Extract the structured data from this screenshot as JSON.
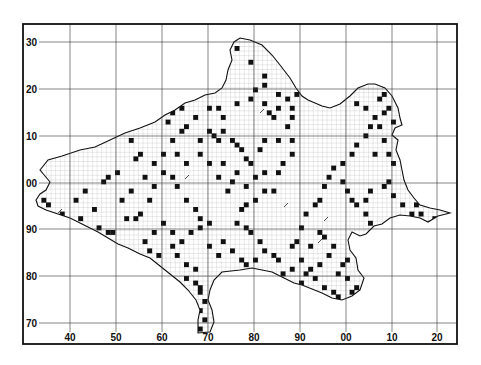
{
  "map": {
    "frame": {
      "left": 23,
      "top": 24,
      "right": 457,
      "bottom": 344
    },
    "x_lines": [
      70,
      116,
      162,
      208,
      254,
      300,
      346,
      392,
      437
    ],
    "x_labels": [
      "40",
      "50",
      "60",
      "70",
      "80",
      "90",
      "00",
      "10",
      "20"
    ],
    "y_lines": [
      42,
      89,
      136,
      183,
      229,
      276,
      323
    ],
    "y_labels": [
      "30",
      "20",
      "10",
      "00",
      "90",
      "80",
      "70"
    ],
    "cell": 4.6,
    "colors": {
      "ink": "#111111",
      "fill": "#ffffff",
      "fine_grid": "#9a9a9a",
      "grid": "#333333"
    },
    "outline": "M40,170 L48,160 L62,156 L80,150 L95,147 L110,140 L125,133 L140,128 L155,122 L165,115 L175,110 L185,103 L195,100 L205,95 L215,93 L222,88 L226,80 L228,70 L232,60 L230,50 L234,42 L240,38 L250,40 L262,45 L272,55 L280,65 L290,78 L296,88 L302,96 L308,100 L315,103 L322,106 L330,108 L340,104 L350,96 L358,88 L368,84 L375,84 L385,88 L392,96 L398,108 L400,118 L402,125 L395,128 L392,135 L398,140 L396,150 L400,160 L402,170 L404,180 L408,190 L414,198 L420,205 L430,208 L440,210 L450,213 L438,216 L428,222 L420,218 L410,216 L400,215 L390,218 L382,224 L374,226 L366,234 L360,236 L352,232 L348,240 L350,250 L356,258 L358,270 L364,278 L360,290 L352,296 L342,300 L332,298 L322,293 L312,289 L302,285 L294,283 L284,278 L272,272 L262,270 L252,268 L240,270 L222,272 L214,280 L210,290 L208,300 L212,310 L214,322 L210,332 L198,333 L198,320 L200,310 L196,300 L188,290 L180,282 L170,274 L160,266 L150,258 L140,254 L128,248 L118,244 L108,238 L98,232 L86,226 L70,218 L58,214 L46,210 L38,206 L36,200 L40,194 L46,190 L50,182 L45,176 Z",
    "occupied_cells": [
      [
        236,
        44
      ],
      [
        250,
        60
      ],
      [
        254,
        88
      ],
      [
        262,
        84
      ],
      [
        264,
        72
      ],
      [
        236,
        100
      ],
      [
        248,
        96
      ],
      [
        216,
        104
      ],
      [
        206,
        104
      ],
      [
        220,
        116
      ],
      [
        260,
        102
      ],
      [
        266,
        110
      ],
      [
        274,
        92
      ],
      [
        270,
        116
      ],
      [
        278,
        108
      ],
      [
        286,
        98
      ],
      [
        290,
        108
      ],
      [
        292,
        116
      ],
      [
        284,
        124
      ],
      [
        296,
        90
      ],
      [
        302,
        84
      ],
      [
        208,
        128
      ],
      [
        212,
        132
      ],
      [
        216,
        140
      ],
      [
        222,
        128
      ],
      [
        230,
        136
      ],
      [
        200,
        138
      ],
      [
        184,
        124
      ],
      [
        180,
        130
      ],
      [
        192,
        116
      ],
      [
        170,
        110
      ],
      [
        178,
        106
      ],
      [
        164,
        118
      ],
      [
        160,
        108
      ],
      [
        152,
        116
      ],
      [
        140,
        112
      ],
      [
        128,
        140
      ],
      [
        132,
        156
      ],
      [
        140,
        152
      ],
      [
        150,
        160
      ],
      [
        236,
        144
      ],
      [
        240,
        148
      ],
      [
        244,
        156
      ],
      [
        248,
        160
      ],
      [
        236,
        168
      ],
      [
        232,
        180
      ],
      [
        244,
        184
      ],
      [
        252,
        176
      ],
      [
        260,
        168
      ],
      [
        258,
        148
      ],
      [
        264,
        140
      ],
      [
        276,
        136
      ],
      [
        288,
        140
      ],
      [
        290,
        150
      ],
      [
        282,
        160
      ],
      [
        274,
        172
      ],
      [
        270,
        188
      ],
      [
        262,
        190
      ],
      [
        254,
        196
      ],
      [
        246,
        204
      ],
      [
        238,
        208
      ],
      [
        236,
        220
      ],
      [
        242,
        224
      ],
      [
        248,
        232
      ],
      [
        256,
        240
      ],
      [
        262,
        248
      ],
      [
        270,
        252
      ],
      [
        278,
        256
      ],
      [
        288,
        246
      ],
      [
        296,
        240
      ],
      [
        300,
        226
      ],
      [
        304,
        212
      ],
      [
        312,
        204
      ],
      [
        318,
        196
      ],
      [
        324,
        184
      ],
      [
        328,
        176
      ],
      [
        332,
        166
      ],
      [
        340,
        160
      ],
      [
        348,
        150
      ],
      [
        356,
        142
      ],
      [
        362,
        134
      ],
      [
        368,
        124
      ],
      [
        372,
        116
      ],
      [
        364,
        108
      ],
      [
        356,
        100
      ],
      [
        376,
        96
      ],
      [
        384,
        92
      ],
      [
        388,
        104
      ],
      [
        382,
        112
      ],
      [
        376,
        122
      ],
      [
        392,
        120
      ],
      [
        396,
        130
      ],
      [
        380,
        140
      ],
      [
        372,
        150
      ],
      [
        388,
        152
      ],
      [
        390,
        162
      ],
      [
        340,
        178
      ],
      [
        344,
        188
      ],
      [
        350,
        196
      ],
      [
        356,
        204
      ],
      [
        364,
        212
      ],
      [
        370,
        220
      ],
      [
        376,
        228
      ],
      [
        362,
        240
      ],
      [
        354,
        248
      ],
      [
        346,
        256
      ],
      [
        340,
        262
      ],
      [
        336,
        270
      ],
      [
        344,
        276
      ],
      [
        352,
        284
      ],
      [
        360,
        288
      ],
      [
        348,
        290
      ],
      [
        338,
        294
      ],
      [
        330,
        290
      ],
      [
        322,
        286
      ],
      [
        314,
        278
      ],
      [
        310,
        268
      ],
      [
        318,
        260
      ],
      [
        326,
        252
      ],
      [
        332,
        244
      ],
      [
        324,
        236
      ],
      [
        316,
        232
      ],
      [
        306,
        246
      ],
      [
        298,
        258
      ],
      [
        290,
        268
      ],
      [
        282,
        272
      ],
      [
        304,
        270
      ],
      [
        300,
        280
      ],
      [
        380,
        184
      ],
      [
        386,
        178
      ],
      [
        392,
        194
      ],
      [
        400,
        202
      ],
      [
        408,
        212
      ],
      [
        414,
        204
      ],
      [
        420,
        210
      ],
      [
        432,
        214
      ],
      [
        426,
        220
      ],
      [
        370,
        188
      ],
      [
        362,
        198
      ],
      [
        82,
        190
      ],
      [
        92,
        208
      ],
      [
        80,
        216
      ],
      [
        98,
        226
      ],
      [
        106,
        232
      ],
      [
        112,
        228
      ],
      [
        124,
        214
      ],
      [
        132,
        218
      ],
      [
        140,
        210
      ],
      [
        148,
        200
      ],
      [
        120,
        196
      ],
      [
        128,
        188
      ],
      [
        150,
        186
      ],
      [
        142,
        174
      ],
      [
        160,
        170
      ],
      [
        168,
        176
      ],
      [
        176,
        186
      ],
      [
        184,
        196
      ],
      [
        192,
        206
      ],
      [
        200,
        214
      ],
      [
        208,
        220
      ],
      [
        196,
        226
      ],
      [
        188,
        232
      ],
      [
        180,
        238
      ],
      [
        168,
        228
      ],
      [
        160,
        222
      ],
      [
        152,
        232
      ],
      [
        142,
        240
      ],
      [
        148,
        248
      ],
      [
        158,
        252
      ],
      [
        168,
        244
      ],
      [
        176,
        252
      ],
      [
        184,
        262
      ],
      [
        192,
        266
      ],
      [
        186,
        274
      ],
      [
        192,
        280
      ],
      [
        196,
        286
      ],
      [
        200,
        292
      ],
      [
        204,
        300
      ],
      [
        200,
        310
      ],
      [
        204,
        318
      ],
      [
        200,
        326
      ],
      [
        48,
        204
      ],
      [
        42,
        196
      ],
      [
        60,
        210
      ],
      [
        72,
        200
      ],
      [
        116,
        170
      ],
      [
        108,
        176
      ],
      [
        102,
        180
      ],
      [
        224,
        190
      ],
      [
        214,
        176
      ],
      [
        220,
        160
      ],
      [
        206,
        160
      ],
      [
        196,
        152
      ],
      [
        186,
        160
      ],
      [
        176,
        150
      ],
      [
        168,
        140
      ],
      [
        160,
        150
      ],
      [
        206,
        244
      ],
      [
        214,
        252
      ],
      [
        222,
        240
      ],
      [
        230,
        248
      ],
      [
        238,
        256
      ],
      [
        246,
        262
      ],
      [
        254,
        256
      ]
    ],
    "hatch_marks": [
      [
        185,
        176
      ],
      [
        222,
        162
      ],
      [
        284,
        204
      ],
      [
        324,
        218
      ],
      [
        58,
        210
      ],
      [
        260,
        110
      ],
      [
        318,
        240
      ]
    ]
  }
}
